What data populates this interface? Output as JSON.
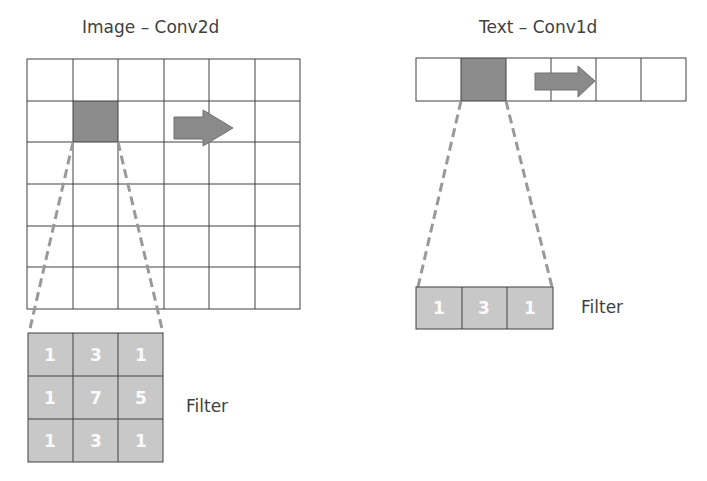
{
  "conv2d": {
    "title": "Image – Conv2d",
    "grid": {
      "rows": 6,
      "cols": 6,
      "highlighted_cell": {
        "row": 1,
        "col": 1
      }
    },
    "arrow": "right-arrow",
    "filter_label": "Filter",
    "filter": [
      [
        "1",
        "3",
        "1"
      ],
      [
        "1",
        "7",
        "5"
      ],
      [
        "1",
        "3",
        "1"
      ]
    ]
  },
  "conv1d": {
    "title": "Text – Conv1d",
    "grid": {
      "rows": 1,
      "cols": 6,
      "highlighted_cell": {
        "row": 0,
        "col": 1
      }
    },
    "arrow": "right-arrow",
    "filter_label": "Filter",
    "filter": [
      [
        "1",
        "3",
        "1"
      ]
    ]
  },
  "colors": {
    "highlight": "#8c8c8c",
    "filter_fill": "#c8c8c8",
    "dashed": "#999999",
    "grid_line": "#404040"
  }
}
